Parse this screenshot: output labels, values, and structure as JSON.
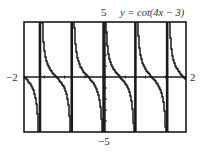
{
  "chart_data": {
    "type": "line",
    "title": "y = cot(4x − 3)",
    "function": "cot(4x - 3)",
    "xlabel": "",
    "ylabel": "",
    "xlim": [
      -2,
      2
    ],
    "ylim": [
      -5,
      5
    ],
    "tick_labels": {
      "xmin": "−2",
      "xmax": "2",
      "ymax": "5",
      "ymin": "−5"
    },
    "asymptotes_x": [
      -1.606,
      -0.821,
      -0.035,
      0.75,
      1.535
    ],
    "grid": false,
    "legend": null,
    "style": "graphing-calculator screen"
  },
  "labels": {
    "equation": "y = cot(4x − 3)",
    "ymax": "5",
    "ymin": "−5",
    "xmin": "−2",
    "xmax": "2"
  },
  "colors": {
    "ink": "#1a1a1a",
    "background": "#ffffff"
  }
}
